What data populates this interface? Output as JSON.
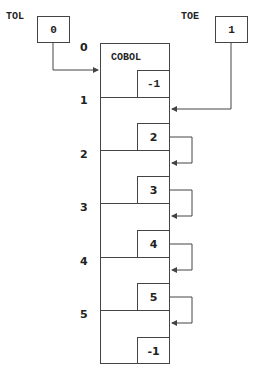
{
  "pointers": {
    "tol": {
      "label": "TOL",
      "value": "0"
    },
    "toe": {
      "label": "TOE",
      "value": "1"
    }
  },
  "row_indices": [
    "0",
    "1",
    "2",
    "3",
    "4",
    "5"
  ],
  "rows": [
    {
      "name": "COBOL",
      "next": "-1"
    },
    {
      "name": "",
      "next": "2"
    },
    {
      "name": "",
      "next": "3"
    },
    {
      "name": "",
      "next": "4"
    },
    {
      "name": "",
      "next": "5"
    },
    {
      "name": "",
      "next": "-1"
    }
  ]
}
